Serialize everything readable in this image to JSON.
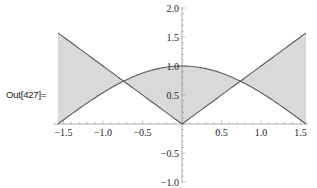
{
  "cell": {
    "output_label": "Out[427]="
  },
  "style": {
    "fill_color": "#d9d9d9",
    "curve_color": "#5a5a5a",
    "axis_color": "#9a9a9a",
    "tick_label_color": "#222222"
  },
  "chart_data": {
    "type": "area",
    "title": "",
    "xlabel": "",
    "ylabel": "",
    "xlim": [
      -1.5708,
      1.5708
    ],
    "ylim": [
      -1.0,
      2.0
    ],
    "grid": false,
    "legend": null,
    "fill": "between curves",
    "series": [
      {
        "name": "Cos[x]",
        "function": "cos(x)",
        "x": [
          -1.5708,
          -1.0,
          -0.739,
          -0.5,
          0.0,
          0.5,
          0.739,
          1.0,
          1.5708
        ],
        "y": [
          0.0,
          0.5403,
          0.739,
          0.8776,
          1.0,
          0.8776,
          0.739,
          0.5403,
          0.0
        ]
      },
      {
        "name": "Abs[x]",
        "function": "abs(x)",
        "x": [
          -1.5708,
          -1.0,
          -0.739,
          -0.5,
          0.0,
          0.5,
          0.739,
          1.0,
          1.5708
        ],
        "y": [
          1.5708,
          1.0,
          0.739,
          0.5,
          0.0,
          0.5,
          0.739,
          1.0,
          1.5708
        ]
      }
    ],
    "intersections": [
      {
        "x": -0.739,
        "y": 0.739
      },
      {
        "x": 0.739,
        "y": 0.739
      }
    ],
    "x_ticks": [
      {
        "value": -1.5,
        "label": "−1.5"
      },
      {
        "value": -1.0,
        "label": "−1.0"
      },
      {
        "value": -0.5,
        "label": "−0.5"
      },
      {
        "value": 0.5,
        "label": "0.5"
      },
      {
        "value": 1.0,
        "label": "1.0"
      },
      {
        "value": 1.5,
        "label": "1.5"
      }
    ],
    "y_ticks": [
      {
        "value": 2.0,
        "label": "2.0"
      },
      {
        "value": 1.5,
        "label": "1.5"
      },
      {
        "value": 1.0,
        "label": "1.0"
      },
      {
        "value": 0.5,
        "label": "0.5"
      },
      {
        "value": -0.5,
        "label": "−0.5"
      },
      {
        "value": -1.0,
        "label": "−1.0"
      }
    ]
  }
}
